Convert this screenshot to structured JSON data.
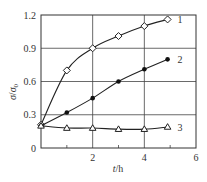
{
  "chart_data": {
    "type": "line",
    "title": "",
    "xlabel": "t/h",
    "ylabel": "σ/σ0",
    "xlim": [
      0,
      6
    ],
    "ylim": [
      0,
      1.2
    ],
    "xticks": [
      "2",
      "4",
      "6"
    ],
    "yticks": [
      "0",
      "0.3",
      "0.6",
      "0.9",
      "1.2"
    ],
    "grid": true,
    "legend_position": "inline-right",
    "series": [
      {
        "name": "1",
        "marker": "open-diamond",
        "x": [
          0,
          1,
          2,
          3,
          4,
          4.9
        ],
        "values": [
          0.21,
          0.7,
          0.9,
          1.01,
          1.1,
          1.16
        ]
      },
      {
        "name": "2",
        "marker": "filled-circle",
        "x": [
          0,
          1,
          2,
          3,
          4,
          4.9
        ],
        "values": [
          0.2,
          0.32,
          0.45,
          0.6,
          0.71,
          0.8
        ]
      },
      {
        "name": "3",
        "marker": "open-triangle",
        "x": [
          0,
          1,
          2,
          3,
          4,
          4.9
        ],
        "values": [
          0.2,
          0.18,
          0.18,
          0.17,
          0.17,
          0.19
        ]
      }
    ]
  },
  "labels": {
    "ylabel_main": "σ",
    "ylabel_sep": "/",
    "ylabel_denom": "σ",
    "ylabel_sub": "0",
    "xlabel_t": "t",
    "xlabel_unit": "/h"
  }
}
